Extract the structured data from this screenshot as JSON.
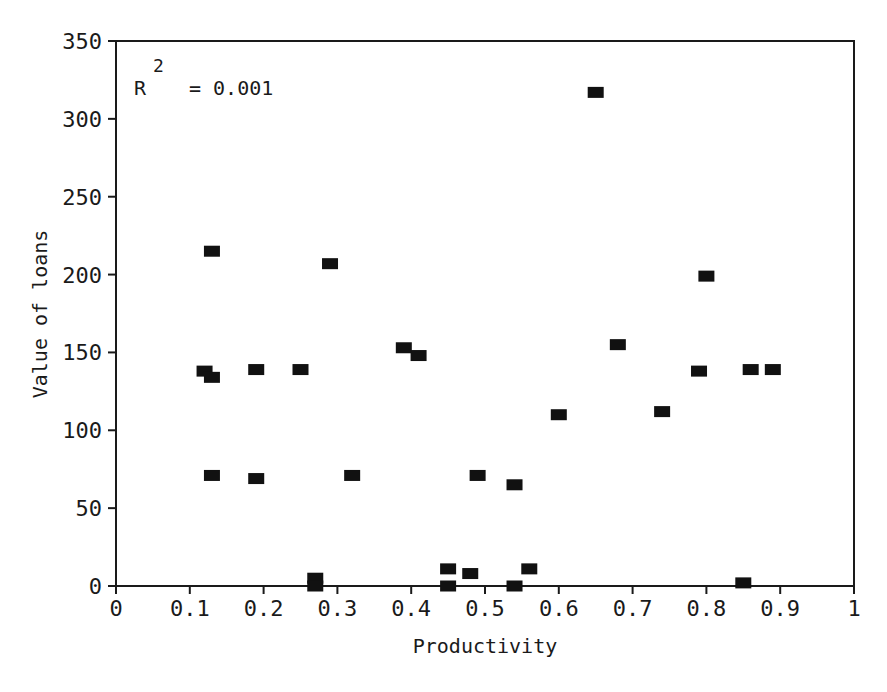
{
  "chart_data": {
    "type": "scatter",
    "title": "",
    "xlabel": "Productivity",
    "ylabel": "Value of loans",
    "xlim": [
      0,
      1
    ],
    "ylim": [
      0,
      350
    ],
    "xticks": [
      0,
      0.1,
      0.2,
      0.3,
      0.4,
      0.5,
      0.6,
      0.7,
      0.8,
      0.9,
      1
    ],
    "xtick_labels": [
      "0",
      "0.1",
      "0.2",
      "0.3",
      "0.4",
      "0.5",
      "0.6",
      "0.7",
      "0.8",
      "0.9",
      "1"
    ],
    "yticks": [
      0,
      50,
      100,
      150,
      200,
      250,
      300,
      350
    ],
    "ytick_labels": [
      "0",
      "50",
      "100",
      "150",
      "200",
      "250",
      "300",
      "350"
    ],
    "grid": false,
    "legend": null,
    "marker": "filled-rectangle",
    "marker_color": "#111111",
    "annotations": [
      {
        "text_main": "R",
        "text_sup": "2",
        "text_rest": "= 0.001",
        "position": "top-left"
      }
    ],
    "series": [
      {
        "name": "observations",
        "points": [
          {
            "x": 0.12,
            "y": 138
          },
          {
            "x": 0.13,
            "y": 134
          },
          {
            "x": 0.13,
            "y": 215
          },
          {
            "x": 0.13,
            "y": 71
          },
          {
            "x": 0.19,
            "y": 139
          },
          {
            "x": 0.19,
            "y": 69
          },
          {
            "x": 0.25,
            "y": 139
          },
          {
            "x": 0.27,
            "y": 5
          },
          {
            "x": 0.27,
            "y": 0
          },
          {
            "x": 0.29,
            "y": 207
          },
          {
            "x": 0.32,
            "y": 71
          },
          {
            "x": 0.39,
            "y": 153
          },
          {
            "x": 0.41,
            "y": 148
          },
          {
            "x": 0.45,
            "y": 11
          },
          {
            "x": 0.45,
            "y": 0
          },
          {
            "x": 0.48,
            "y": 8
          },
          {
            "x": 0.49,
            "y": 71
          },
          {
            "x": 0.54,
            "y": 65
          },
          {
            "x": 0.54,
            "y": 0
          },
          {
            "x": 0.56,
            "y": 11
          },
          {
            "x": 0.6,
            "y": 110
          },
          {
            "x": 0.65,
            "y": 317
          },
          {
            "x": 0.68,
            "y": 155
          },
          {
            "x": 0.74,
            "y": 112
          },
          {
            "x": 0.79,
            "y": 138
          },
          {
            "x": 0.8,
            "y": 199
          },
          {
            "x": 0.85,
            "y": 2
          },
          {
            "x": 0.86,
            "y": 139
          },
          {
            "x": 0.89,
            "y": 139
          }
        ]
      }
    ]
  }
}
